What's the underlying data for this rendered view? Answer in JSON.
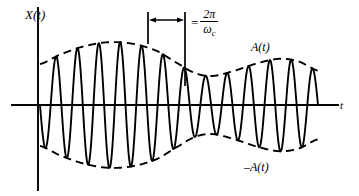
{
  "figure": {
    "background_color": "#ffffff",
    "stroke_color": "#000000"
  },
  "axes": {
    "y_label": "X(t)",
    "x_label": "t",
    "x_axis": {
      "x_start": 12,
      "x_end": 338,
      "y": 105
    },
    "y_axis": {
      "x": 38,
      "y_start": 8,
      "y_end": 190
    }
  },
  "labels": {
    "upper_envelope": "A(t)",
    "lower_envelope": "–A(t)"
  },
  "period_annotation": {
    "equals": "=",
    "numerator": "2π",
    "denominator_base": "ω",
    "denominator_sub": "c",
    "bar_left_x": 148,
    "bar_right_x": 185,
    "bar_top_y": 12,
    "bar_bottom_y": 28,
    "right_bar_bottom_y": 86,
    "arrow_y": 20
  },
  "chart_data": {
    "type": "line",
    "title": "",
    "xlabel": "t",
    "ylabel": "X(t)",
    "grid": false,
    "legend": null,
    "xlim": [
      0,
      1
    ],
    "ylim": [
      -1.1,
      1.1
    ],
    "carrier_cycles": 13,
    "carrier_period_px": 21.5,
    "envelope_control_points": [
      {
        "t": 0.0,
        "amplitude": 0.62
      },
      {
        "t": 0.07,
        "amplitude": 0.76
      },
      {
        "t": 0.15,
        "amplitude": 0.88
      },
      {
        "t": 0.24,
        "amplitude": 0.95
      },
      {
        "t": 0.33,
        "amplitude": 0.93
      },
      {
        "t": 0.42,
        "amplitude": 0.82
      },
      {
        "t": 0.5,
        "amplitude": 0.62
      },
      {
        "t": 0.56,
        "amplitude": 0.48
      },
      {
        "t": 0.62,
        "amplitude": 0.44
      },
      {
        "t": 0.7,
        "amplitude": 0.52
      },
      {
        "t": 0.78,
        "amplitude": 0.63
      },
      {
        "t": 0.86,
        "amplitude": 0.7
      },
      {
        "t": 0.93,
        "amplitude": 0.66
      },
      {
        "t": 1.0,
        "amplitude": 0.52
      }
    ],
    "series": [
      {
        "name": "X(t)",
        "style": "solid",
        "width": 1.9
      },
      {
        "name": "A(t)",
        "style": "dashed",
        "width": 1.9
      },
      {
        "name": "-A(t)",
        "style": "dashed",
        "width": 1.9
      }
    ]
  },
  "geometry": {
    "wave_x_start": 40,
    "wave_x_end": 318,
    "center_y": 105,
    "amplitude_scale_px": 66
  }
}
